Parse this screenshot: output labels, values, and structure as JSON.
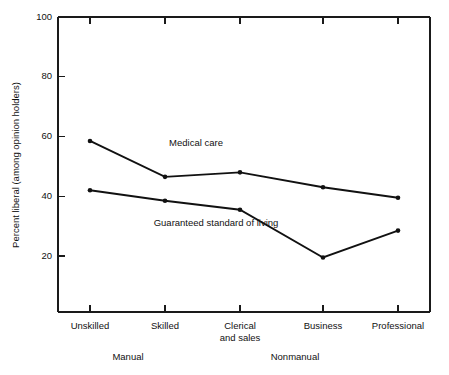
{
  "chart_data": {
    "type": "line",
    "title": "",
    "xlabel": "",
    "ylabel": "Percent liberal (among opinion holders)",
    "categories": [
      "Unskilled",
      "Skilled",
      "Clerical and sales",
      "Business",
      "Professional"
    ],
    "category_labels": [
      {
        "line1": "Unskilled",
        "line2": ""
      },
      {
        "line1": "Skilled",
        "line2": ""
      },
      {
        "line1": "Clerical",
        "line2": "and sales"
      },
      {
        "line1": "Business",
        "line2": ""
      },
      {
        "line1": "Professional",
        "line2": ""
      }
    ],
    "group_labels": [
      {
        "text": "Manual",
        "spans": [
          "Unskilled",
          "Skilled"
        ]
      },
      {
        "text": "Nonmanual",
        "spans": [
          "Clerical and sales",
          "Business",
          "Professional"
        ]
      }
    ],
    "series": [
      {
        "name": "Medical care",
        "values": [
          58.5,
          46.5,
          48.0,
          43.0,
          39.5
        ]
      },
      {
        "name": "Guaranteed standard of living",
        "values": [
          42.0,
          38.5,
          35.5,
          19.5,
          28.5
        ]
      }
    ],
    "ylim": [
      0,
      100
    ],
    "yticks": [
      20,
      40,
      60,
      80,
      100
    ],
    "ytick_labels": [
      "20",
      "40",
      "60",
      "80",
      "100"
    ],
    "grid": false,
    "legend_position": "inline-annotations",
    "annotations": [
      {
        "text": "Medical care",
        "series": "Medical care"
      },
      {
        "text": "Guaranteed standard of living",
        "series": "Guaranteed standard of living"
      }
    ],
    "line_color": "#111111",
    "axis_color": "#1a1a1a",
    "background_color": "#ffffff"
  }
}
